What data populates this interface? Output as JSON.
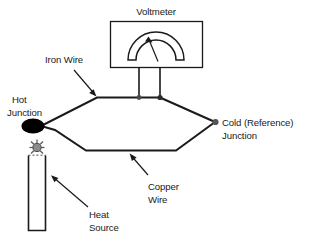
{
  "diagram": {
    "background_color": "#ffffff",
    "line_color": "#1a1a1a",
    "text_color": "#1a1a1a",
    "junction_hot_color": "#000000",
    "junction_cold_color": "#555555",
    "heat_glow_color": "#8c8c8c",
    "labels": {
      "voltmeter": "Voltmeter",
      "iron_wire": "Iron Wire",
      "hot_junction_line1": "Hot",
      "hot_junction_line2": "Junction",
      "cold_junction_line1": "Cold (Reference)",
      "cold_junction_line2": "Junction",
      "copper_wire_line1": "Copper",
      "copper_wire_line2": "Wire",
      "heat_source_line1": "Heat",
      "heat_source_line2": "Source"
    },
    "icons": {
      "gauge": "analog-meter-needle-icon",
      "hot_junction": "hot-junction-dot-icon",
      "cold_junction": "cold-junction-dot-icon",
      "heat_glow": "heat-glow-icon",
      "heat_tube": "heat-source-tube-icon"
    }
  }
}
